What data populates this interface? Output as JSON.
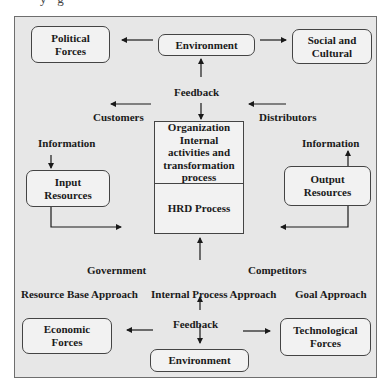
{
  "diagram": {
    "caption_partial": "y        ·        g",
    "environment_top": "Environment",
    "environment_bottom": "Environment",
    "political_forces": "Political\nForces",
    "social_cultural": "Social and\nCultural",
    "economic_forces": "Economic\nForces",
    "technological_forces": "Technological\nForces",
    "feedback_top": "Feedback",
    "feedback_bottom": "Feedback",
    "customers": "Customers",
    "distributors": "Distributors",
    "government": "Government",
    "competitors": "Competitors",
    "information_left": "Information",
    "information_right": "Information",
    "input_resources": "Input\nResources",
    "output_resources": "Output\nResources",
    "organization_process": "Organization\nInternal\nactivities and\ntransformation\nprocess",
    "hrd_process": "HRD Process",
    "resource_base_approach": "Resource Base Approach",
    "internal_process_approach": "Internal Process Approach",
    "goal_approach": "Goal Approach"
  }
}
